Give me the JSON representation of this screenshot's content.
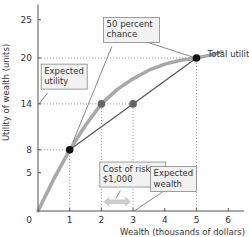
{
  "chart_data": {
    "type": "line",
    "title": "",
    "xlabel": "Wealth (thousands of dollars)",
    "ylabel": "Utility of wealth (units)",
    "xlim": [
      0,
      6.5
    ],
    "ylim": [
      0,
      27
    ],
    "x_ticks": [
      0,
      1,
      2,
      3,
      4,
      5,
      6
    ],
    "y_ticks": [
      5,
      8,
      14,
      20,
      25
    ],
    "origin_label": "0",
    "grid": false,
    "series": [
      {
        "name": "Total utility",
        "color": "#a8a8a8",
        "points": [
          [
            0,
            0
          ],
          [
            0.5,
            4.2
          ],
          [
            1,
            8
          ],
          [
            1.5,
            11.2
          ],
          [
            2,
            14
          ],
          [
            2.5,
            15.9
          ],
          [
            3,
            17.3
          ],
          [
            3.5,
            18.4
          ],
          [
            4,
            19.2
          ],
          [
            4.5,
            19.7
          ],
          [
            5,
            20
          ],
          [
            5.5,
            20.45
          ],
          [
            5.8,
            20.8
          ]
        ]
      },
      {
        "name": "Expected utility chord",
        "color": "#555555",
        "points": [
          [
            1,
            8
          ],
          [
            5,
            20
          ]
        ]
      }
    ],
    "markers": [
      {
        "name": "low-wealth-point",
        "x": 1,
        "y": 8,
        "color": "#111111"
      },
      {
        "name": "high-wealth-point",
        "x": 5,
        "y": 20,
        "color": "#111111"
      },
      {
        "name": "certain-equivalent-point",
        "x": 2,
        "y": 14,
        "color": "#666666"
      },
      {
        "name": "expected-wealth-point",
        "x": 3,
        "y": 14,
        "color": "#666666"
      }
    ],
    "guides": [
      {
        "name": "guide-y20",
        "from": [
          0,
          20
        ],
        "to": [
          5,
          20
        ]
      },
      {
        "name": "guide-y14",
        "from": [
          0,
          14
        ],
        "to": [
          3,
          14
        ]
      },
      {
        "name": "guide-y8",
        "from": [
          0,
          8
        ],
        "to": [
          1,
          8
        ]
      },
      {
        "name": "guide-x1",
        "from": [
          1,
          0
        ],
        "to": [
          1,
          8
        ]
      },
      {
        "name": "guide-x2",
        "from": [
          2,
          0
        ],
        "to": [
          2,
          14
        ]
      },
      {
        "name": "guide-x3",
        "from": [
          3,
          0
        ],
        "to": [
          3,
          14
        ]
      },
      {
        "name": "guide-x5",
        "from": [
          5,
          0
        ],
        "to": [
          5,
          20
        ]
      }
    ],
    "cost_of_risk_arrow": {
      "from": 2,
      "to": 3,
      "y": 1.2,
      "color": "#cccccc"
    },
    "annotations": [
      {
        "name": "label-total-utility",
        "lines": [
          "Total utility"
        ],
        "boxed": false,
        "anchor": [
          5.35,
          21.4
        ],
        "pointer": null
      },
      {
        "name": "label-fifty-percent-chance",
        "lines": [
          "50 percent",
          "chance"
        ],
        "boxed": true,
        "anchor": [
          2.07,
          25.3
        ],
        "pointers": [
          [
            [
              2.33,
              21.5
            ],
            [
              1.1,
              9
            ]
          ],
          [
            [
              3.35,
              22.2
            ],
            [
              4.9,
              20.1
            ]
          ]
        ]
      },
      {
        "name": "label-expected-utility",
        "lines": [
          "Expected",
          "utility"
        ],
        "boxed": true,
        "anchor": [
          0.1,
          19.2
        ],
        "pointers": [
          [
            [
              0.3,
              15.4
            ],
            [
              0.03,
              14
            ]
          ]
        ]
      },
      {
        "name": "label-cost-of-risk",
        "lines": [
          "Cost of risk",
          "$1,000"
        ],
        "boxed": true,
        "anchor": [
          1.95,
          6.4
        ],
        "pointers": [
          [
            [
              2.6,
              2.7
            ],
            [
              2.45,
              1.6
            ]
          ]
        ]
      },
      {
        "name": "label-expected-wealth",
        "lines": [
          "Expected",
          "wealth"
        ],
        "boxed": true,
        "anchor": [
          3.55,
          5.8
        ],
        "pointers": [
          [
            [
              4.0,
              2.7
            ],
            [
              3.05,
              0.05
            ]
          ]
        ]
      }
    ]
  }
}
